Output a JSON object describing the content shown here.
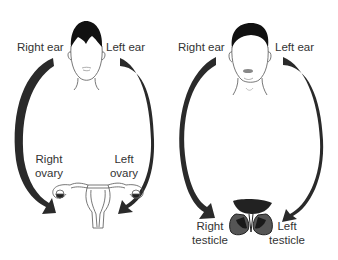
{
  "diagram": {
    "type": "body correspondence diagram",
    "colors": {
      "arrow": "#2a2a2a",
      "hair": "#111111",
      "line": "#555555",
      "text": "#333333",
      "background": "#ffffff"
    },
    "female": {
      "label_right_ear": "Right ear",
      "label_left_ear": "Left ear",
      "label_right_ovary_1": "Right",
      "label_right_ovary_2": "ovary",
      "label_left_ovary_1": "Left",
      "label_left_ovary_2": "ovary"
    },
    "male": {
      "label_right_ear": "Right ear",
      "label_left_ear": "Left ear",
      "label_right_testicle_1": "Right",
      "label_right_testicle_2": "testicle",
      "label_left_testicle_1": "Left",
      "label_left_testicle_2": "testicle"
    },
    "edges": [
      {
        "from": "Right ear (female)",
        "to": "Right ovary"
      },
      {
        "from": "Left ear (female)",
        "to": "Left ovary"
      },
      {
        "from": "Right ear (male)",
        "to": "Right testicle"
      },
      {
        "from": "Left ear (male)",
        "to": "Left testicle"
      }
    ]
  }
}
